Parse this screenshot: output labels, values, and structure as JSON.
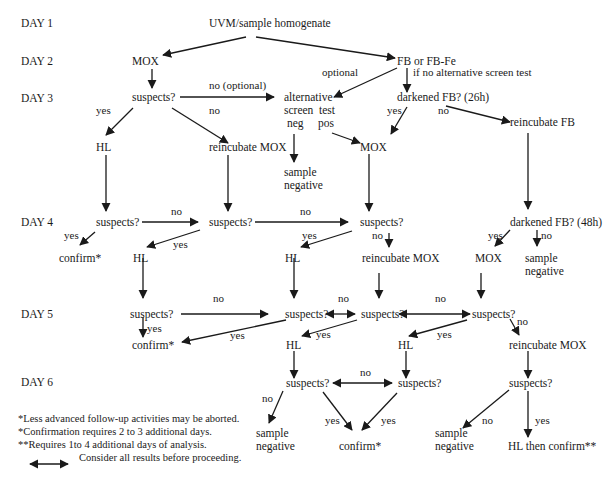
{
  "days": [
    "DAY 1",
    "DAY 2",
    "DAY 3",
    "DAY 4",
    "DAY 5",
    "DAY 6"
  ],
  "nodes": {
    "start": "UVM/sample homogenate",
    "mox_d2": "MOX",
    "fb": "FB or FB-Fe",
    "suspects_d3": "suspects?",
    "alt_l1": "alternative",
    "alt_l2a": "screen",
    "alt_l2b": "test",
    "alt_l3a": "neg",
    "alt_l3b": "pos",
    "darkened_26": "darkened FB? (26h)",
    "hl_d3": "HL",
    "reinc_mox_d3": "reincubate MOX",
    "sample_neg_a_1": "sample",
    "sample_neg_a_2": "negative",
    "mox_d3": "MOX",
    "reinc_fb": "reincubate FB",
    "suspects_d4a": "suspects?",
    "suspects_d4b": "suspects?",
    "suspects_d4c": "suspects?",
    "darkened_48": "darkened FB? (48h)",
    "confirm_d4": "confirm*",
    "hl_d4a": "HL",
    "hl_d4b": "HL",
    "reinc_mox_d4": "reincubate MOX",
    "mox_d4": "MOX",
    "sample_neg_b_1": "sample",
    "sample_neg_b_2": "negative",
    "suspects_d5a": "suspects?",
    "suspects_d5b": "suspects?",
    "suspects_d5c": "suspects?",
    "suspects_d5d": "suspects?",
    "confirm_d5": "confirm*",
    "hl_d5a": "HL",
    "hl_d5b": "HL",
    "reinc_mox_d5": "reincubate MOX",
    "suspects_d6a": "suspects?",
    "suspects_d6b": "suspects?",
    "suspects_d6c": "suspects?",
    "sample_neg_c_1": "sample",
    "sample_neg_c_2": "negative",
    "confirm_d6": "confirm*",
    "sample_neg_d_1": "sample",
    "sample_neg_d_2": "negative",
    "hl_then_confirm": "HL then confirm**"
  },
  "edge_labels": {
    "optional": "optional",
    "if_no_alt": "if no alternative screen test",
    "no_optional": "no (optional)",
    "d3_yes": "yes",
    "d3_no": "no",
    "d26_yes": "yes",
    "d26_no": "no",
    "d4a_no": "no",
    "d4a_yes": "yes",
    "d4b_no": "no",
    "d4b_yes": "yes",
    "d4c_yes": "yes",
    "d4c_no": "no",
    "d48_yes": "yes",
    "d48_no": "no",
    "d5a_no": "no",
    "d5a_yes": "yes",
    "d5a_yes2": "yes",
    "d5b_no": "no",
    "d5b_yes": "yes",
    "d5c_no": "no",
    "d5c_yes": "yes",
    "d5d_no": "no",
    "d6_no_mid": "no",
    "d6a_no": "no",
    "d6a_yes": "yes",
    "d6b_yes": "yes",
    "d6c_no": "no",
    "d6c_yes": "yes"
  },
  "notes": [
    "*Less advanced follow-up activities may be aborted.",
    "*Confirmation requires 2 to 3 additional days.",
    "**Requires 1to 4 additional days of analysis."
  ],
  "legend": {
    "icon": "double-arrow-icon",
    "text": "Consider all results before proceeding."
  }
}
